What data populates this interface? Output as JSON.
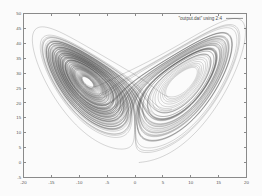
{
  "window": {
    "title": "Lorenz Attractor Plot",
    "background_color": "#fbfbfb",
    "width": 262,
    "height": 196
  },
  "legend": {
    "label": "\"output.dat\" using 2:4",
    "position": "top-right",
    "sample_color": "#2b2b2b"
  },
  "axes": {
    "frame_color": "#8a8a8a",
    "tick_label_color": "#555555",
    "x_tick_labels": [
      "-20",
      "-15",
      "-10",
      "-5",
      "0",
      "5",
      "10",
      "15",
      "20"
    ],
    "y_tick_labels": [
      "-5",
      "0",
      "5",
      "10",
      "15",
      "20",
      "25",
      "30",
      "35",
      "40",
      "45",
      "50"
    ]
  },
  "chart_data": {
    "type": "line",
    "title": "",
    "xlabel": "",
    "ylabel": "",
    "xlim": [
      -20,
      20
    ],
    "ylim": [
      -5,
      50
    ],
    "x_ticks": [
      -20,
      -15,
      -10,
      -5,
      0,
      5,
      10,
      15,
      20
    ],
    "y_ticks": [
      -5,
      0,
      5,
      10,
      15,
      20,
      25,
      30,
      35,
      40,
      45,
      50
    ],
    "grid": false,
    "legend_position": "top-right",
    "series": [
      {
        "name": "\"output.dat\" using 2:4",
        "color": "#2b2b2b",
        "description": "Lorenz attractor trajectory projected onto the x-z plane, producing the classic two-lobed butterfly with white elliptical voids at each spiral centre.",
        "generator": {
          "system": "lorenz",
          "sigma": 10,
          "rho": 28,
          "beta": 2.6666666666666665,
          "dt": 0.0042,
          "steps": 26000,
          "initial": [
            0.72,
            0.58,
            0.05
          ],
          "plot_axes": [
            "x",
            "z"
          ]
        }
      }
    ]
  }
}
